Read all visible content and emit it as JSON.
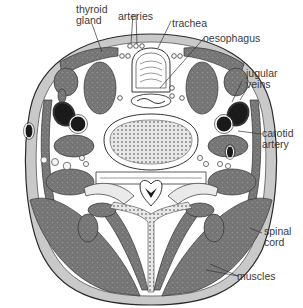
{
  "diagram": {
    "colors": {
      "skin": "#c9c9c9",
      "outline": "#2a2a2a",
      "muscle": "#6e6e6e",
      "background": "#ffffff",
      "vessel": "#1a1a1a",
      "label_text": "#3a3a3a"
    },
    "labels": {
      "thyroid_gland": "thyroid\ngland",
      "arteries": "arteries",
      "trachea": "trachea",
      "oesophagus": "oesophagus",
      "jugular_veins": "jugular\nveins",
      "carotid_artery": "carotid\nartery",
      "spinal_cord": "spinal\ncord",
      "muscles": "muscles"
    }
  }
}
